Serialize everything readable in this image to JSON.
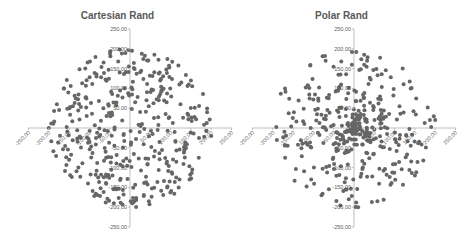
{
  "colors": {
    "marker": "#666666",
    "axis": "#bfbfbf",
    "tick_text": "#595959",
    "title": "#595959"
  },
  "chart_data": [
    {
      "type": "scatter",
      "title": "Cartesian Rand",
      "xlabel": "",
      "ylabel": "",
      "xlim": [
        -250,
        250
      ],
      "ylim": [
        -250,
        250
      ],
      "xticks": [
        "-250,00",
        "-200,00",
        "-150,00",
        "-100,00",
        "-50,00",
        "0,00",
        "50,00",
        "100,00",
        "150,00",
        "200,00",
        "250,00"
      ],
      "yticks": [
        "250,00",
        "200,00",
        "150,00",
        "100,00",
        "50,00",
        "0,00",
        "-50,00",
        "-100,00",
        "-150,00",
        "-200,00",
        "-250,00"
      ],
      "grid": false,
      "legend": "none",
      "distribution": "uniform random x,y within circle radius 200",
      "point_count": 400,
      "generator": {
        "mode": "cartesian",
        "radius": 200,
        "seed": 7
      },
      "sample_points": [
        [
          5,
          195
        ],
        [
          -20,
          188
        ],
        [
          60,
          185
        ],
        [
          -110,
          150
        ],
        [
          150,
          120
        ],
        [
          -180,
          60
        ],
        [
          190,
          40
        ],
        [
          -150,
          -80
        ],
        [
          120,
          -150
        ],
        [
          -40,
          -190
        ],
        [
          10,
          -185
        ],
        [
          -200,
          0
        ],
        [
          200,
          -20
        ],
        [
          80,
          100
        ],
        [
          -60,
          -60
        ]
      ]
    },
    {
      "type": "scatter",
      "title": "Polar Rand",
      "xlabel": "",
      "ylabel": "",
      "xlim": [
        -250,
        250
      ],
      "ylim": [
        -250,
        250
      ],
      "xticks": [
        "-250,00",
        "-200,00",
        "-150,00",
        "-100,00",
        "-50,00",
        "0,00",
        "50,00",
        "100,00",
        "150,00",
        "200,00",
        "250,00"
      ],
      "yticks": [
        "250,00",
        "200,00",
        "150,00",
        "100,00",
        "50,00",
        "0,00",
        "-50,00",
        "-100,00",
        "-150,00",
        "-200,00",
        "-250,00"
      ],
      "grid": false,
      "legend": "none",
      "distribution": "uniform random angle and radius (denser near center), radius max 200",
      "point_count": 400,
      "generator": {
        "mode": "polar",
        "radius": 200,
        "seed": 13
      },
      "sample_points": [
        [
          -5,
          192
        ],
        [
          25,
          185
        ],
        [
          -70,
          170
        ],
        [
          120,
          150
        ],
        [
          -170,
          100
        ],
        [
          200,
          20
        ],
        [
          -190,
          -30
        ],
        [
          150,
          -120
        ],
        [
          -80,
          -170
        ],
        [
          10,
          -200
        ],
        [
          0,
          0
        ],
        [
          5,
          10
        ],
        [
          -10,
          -5
        ],
        [
          30,
          -20
        ],
        [
          -20,
          30
        ]
      ]
    }
  ]
}
